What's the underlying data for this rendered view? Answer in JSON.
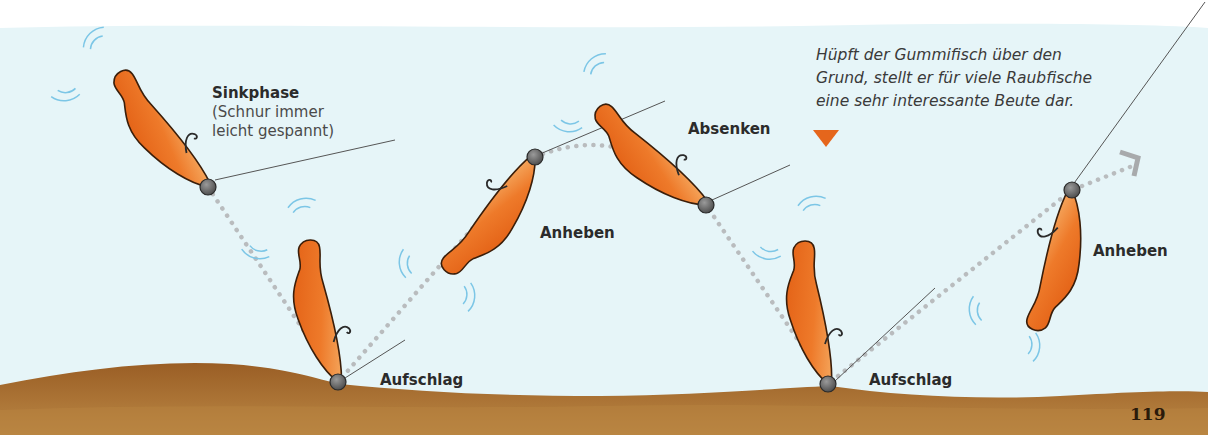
{
  "labels": {
    "sinkphase_title": "Sinkphase",
    "sinkphase_sub1": "(Schnur immer",
    "sinkphase_sub2": "leicht gespannt)",
    "anheben_1": "Anheben",
    "absenken": "Absenken",
    "aufschlag_1": "Aufschlag",
    "aufschlag_2": "Aufschlag",
    "anheben_2": "Anheben"
  },
  "caption": {
    "line1": "Hüpft der Gummifisch über den",
    "line2": "Grund, stellt er für viele Raubfische",
    "line3": "eine sehr interessante Beute dar."
  },
  "page_number": "119",
  "colors": {
    "water": "#e6f5f8",
    "ground_top": "#a0642a",
    "ground_bottom": "#b88440",
    "lure_dark": "#e05a10",
    "lure_light": "#f5a050",
    "marker": "#e5661c",
    "path_dots": "#b9bcbe",
    "motion_lines": "#7cc6e6"
  }
}
